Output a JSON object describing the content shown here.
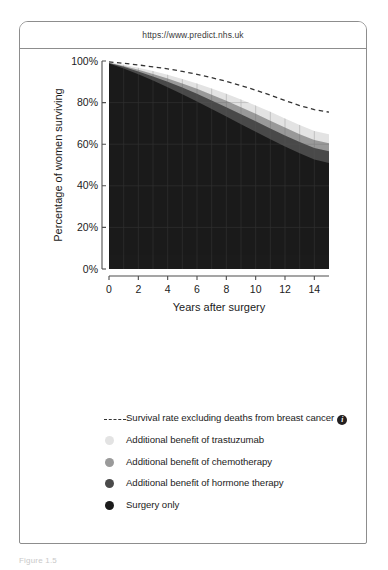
{
  "browser": {
    "url": "https://www.predict.nhs.uk"
  },
  "caption": "Figure 1.5",
  "legend": {
    "items": [
      {
        "marker": "dashed-line",
        "color": "#333333",
        "label": "Survival rate excluding deaths from breast cancer",
        "info_icon": "i",
        "has_info": true
      },
      {
        "marker": "dot",
        "color": "#e3e3e3",
        "label": "Additional benefit of trastuzumab",
        "has_info": false
      },
      {
        "marker": "dot",
        "color": "#9a9a9a",
        "label": "Additional benefit of chemotherapy",
        "has_info": false
      },
      {
        "marker": "dot",
        "color": "#4a4a4a",
        "label": "Additional benefit of hormone therapy",
        "has_info": false
      },
      {
        "marker": "dot",
        "color": "#1b1b1b",
        "label": "Surgery only",
        "has_info": false
      }
    ]
  },
  "chart_data": {
    "type": "area",
    "title": "",
    "xlabel": "Years after surgery",
    "ylabel": "Percentage of women surviving",
    "xlim": [
      0,
      15
    ],
    "ylim": [
      0,
      100
    ],
    "xticks": [
      0,
      2,
      4,
      6,
      8,
      10,
      12,
      14
    ],
    "xtick_labels": [
      "0",
      "2",
      "4",
      "6",
      "8",
      "10",
      "12",
      "14"
    ],
    "yticks": [
      0,
      20,
      40,
      60,
      80,
      100
    ],
    "ytick_labels": [
      "0%",
      "20%",
      "40%",
      "60%",
      "80%",
      "100%"
    ],
    "grid": true,
    "grid_color": "#5a5a5a",
    "legend_position": "below",
    "x": [
      0,
      1,
      2,
      3,
      4,
      5,
      6,
      7,
      8,
      9,
      10,
      11,
      12,
      13,
      14,
      15
    ],
    "series": [
      {
        "name": "Survival rate excluding deaths from breast cancer",
        "type": "dashed-line",
        "color": "#333333",
        "values": [
          99.6,
          98.9,
          98.1,
          97.2,
          96.2,
          95.0,
          93.6,
          92.0,
          90.2,
          88.2,
          86.0,
          83.6,
          81.0,
          78.6,
          76.6,
          75.4
        ]
      },
      {
        "name": "Additional benefit of trastuzumab",
        "type": "band-top",
        "color": "#e3e3e3",
        "values": [
          99.4,
          98.2,
          96.8,
          95.2,
          93.4,
          91.4,
          89.2,
          86.8,
          84.2,
          81.5,
          78.6,
          75.6,
          72.4,
          69.2,
          66.4,
          64.8
        ]
      },
      {
        "name": "Additional benefit of chemotherapy",
        "type": "band",
        "color": "#9a9a9a",
        "values": [
          99.2,
          97.6,
          95.8,
          93.8,
          91.6,
          89.2,
          86.6,
          83.8,
          80.9,
          77.8,
          74.6,
          71.3,
          68.0,
          64.8,
          62.0,
          60.4
        ]
      },
      {
        "name": "Additional benefit of hormone therapy",
        "type": "band",
        "color": "#4a4a4a",
        "values": [
          99.0,
          97.2,
          95.0,
          92.6,
          90.0,
          87.2,
          84.2,
          81.0,
          77.8,
          74.4,
          71.0,
          67.6,
          64.2,
          61.0,
          58.2,
          56.6
        ]
      },
      {
        "name": "Surgery only",
        "type": "band-bottom",
        "color": "#1b1b1b",
        "values": [
          98.8,
          96.4,
          93.6,
          90.6,
          87.4,
          84.0,
          80.5,
          76.9,
          73.3,
          69.6,
          66.0,
          62.4,
          58.9,
          55.6,
          52.6,
          51.0
        ]
      }
    ]
  }
}
